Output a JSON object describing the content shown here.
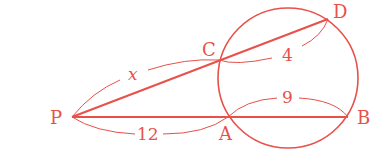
{
  "diagram": {
    "type": "secant-secant theorem figure",
    "color": "#e8504a",
    "circle": {
      "cx": 288,
      "cy": 78,
      "r": 70
    },
    "points": {
      "P": {
        "label": "P",
        "x": 72,
        "y": 117
      },
      "C": {
        "label": "C",
        "x": 219,
        "y": 60
      },
      "D": {
        "label": "D",
        "x": 328,
        "y": 19
      },
      "A": {
        "label": "A",
        "x": 228,
        "y": 117
      },
      "B": {
        "label": "B",
        "x": 348,
        "y": 117
      }
    },
    "segments": [
      {
        "from": "P",
        "to": "D"
      },
      {
        "from": "P",
        "to": "B"
      }
    ],
    "measures": {
      "PC": "x",
      "CD": "4",
      "PA": "12",
      "AB": "9"
    }
  }
}
